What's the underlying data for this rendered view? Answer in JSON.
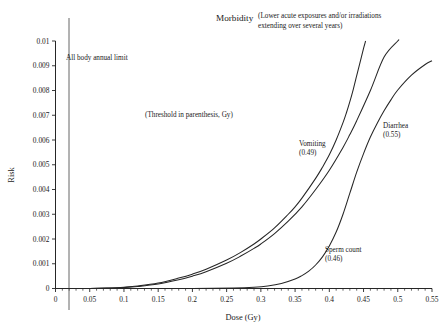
{
  "chart_data": {
    "type": "line",
    "title": "Morbidity",
    "subtitle_line1": "(Lower acute exposures and/or irradiations",
    "subtitle_line2": "extending over several years)",
    "xlabel": "Dose (Gy)",
    "ylabel": "Risk",
    "xlim": [
      0,
      0.55
    ],
    "ylim": [
      0,
      0.01
    ],
    "grid": false,
    "legend_position": "inline-annotations",
    "xticks": [
      "0",
      "0.05",
      "0.1",
      "0.15",
      "0.2",
      "0.25",
      "0.3",
      "0.35",
      "0.4",
      "0.45",
      "0.5",
      "0.55"
    ],
    "xtick_values": [
      0,
      0.05,
      0.1,
      0.15,
      0.2,
      0.25,
      0.3,
      0.35,
      0.4,
      0.45,
      0.5,
      0.55
    ],
    "yticks": [
      "0",
      "0.001",
      "0.002",
      "0.003",
      "0.004",
      "0.005",
      "0.006",
      "0.007",
      "0.008",
      "0.009",
      "0.01"
    ],
    "ytick_values": [
      0,
      0.001,
      0.002,
      0.003,
      0.004,
      0.005,
      0.006,
      0.007,
      0.008,
      0.009,
      0.01
    ],
    "notes": [
      {
        "id": "threshold-note",
        "text": "(Threshold in parenthesis, Gy)",
        "x": 0.175,
        "y": 0.0069
      },
      {
        "id": "limit-note",
        "text": "All body annual limit",
        "x": 0.035,
        "y": 0.0092
      }
    ],
    "reference_lines": [
      {
        "id": "all-body-annual-limit",
        "orientation": "vertical",
        "x": 0.02,
        "label": "All body annual limit"
      }
    ],
    "series": [
      {
        "name": "Vomiting",
        "threshold": "0.49",
        "label_line1": "Vomiting",
        "label_line2": "(0.49)",
        "label_x": 0.345,
        "label_y": 0.0058,
        "x": [
          0.0,
          0.05,
          0.08,
          0.1,
          0.12,
          0.15,
          0.18,
          0.2,
          0.22,
          0.25,
          0.27,
          0.29,
          0.3,
          0.32,
          0.34,
          0.35,
          0.36,
          0.38,
          0.39,
          0.4,
          0.41,
          0.42,
          0.425,
          0.43,
          0.435,
          0.44,
          0.445,
          0.45,
          0.455
        ],
        "y": [
          0.0,
          0.0,
          2e-05,
          5e-05,
          0.0001,
          0.00022,
          0.00042,
          0.00058,
          0.00078,
          0.00115,
          0.00145,
          0.0018,
          0.002,
          0.00245,
          0.003,
          0.0033,
          0.00365,
          0.00445,
          0.0049,
          0.0054,
          0.006,
          0.0067,
          0.0071,
          0.00755,
          0.00805,
          0.0086,
          0.00915,
          0.0097,
          0.0102
        ]
      },
      {
        "name": "Diarrhea",
        "threshold": "0.55",
        "label_line1": "Diarrhea",
        "label_line2": "(0.55)",
        "label_x": 0.465,
        "label_y": 0.0063,
        "x": [
          0.0,
          0.05,
          0.08,
          0.1,
          0.12,
          0.15,
          0.18,
          0.2,
          0.22,
          0.25,
          0.27,
          0.29,
          0.3,
          0.32,
          0.34,
          0.36,
          0.38,
          0.4,
          0.42,
          0.43,
          0.44,
          0.46,
          0.48,
          0.5,
          0.51
        ],
        "y": [
          0.0,
          0.0,
          2e-05,
          4e-05,
          8e-05,
          0.00018,
          0.00035,
          0.0005,
          0.00068,
          0.00102,
          0.0013,
          0.00162,
          0.0018,
          0.00222,
          0.00272,
          0.0033,
          0.004,
          0.00478,
          0.0057,
          0.00622,
          0.00678,
          0.008,
          0.00935,
          0.01,
          0.0102
        ]
      },
      {
        "name": "Sperm count",
        "threshold": "0.46",
        "label_line1": "Sperm count",
        "label_line2": "(0.46)",
        "label_x": 0.375,
        "label_y": 0.00145,
        "x": [
          0.0,
          0.1,
          0.2,
          0.26,
          0.29,
          0.31,
          0.33,
          0.35,
          0.36,
          0.37,
          0.38,
          0.39,
          0.4,
          0.41,
          0.42,
          0.43,
          0.44,
          0.45,
          0.46,
          0.47,
          0.48,
          0.49,
          0.5,
          0.52,
          0.54,
          0.55
        ],
        "y": [
          0.0,
          0.0,
          0.0,
          2e-05,
          5e-05,
          0.0001,
          0.0002,
          0.00038,
          0.00052,
          0.0007,
          0.00095,
          0.00128,
          0.00172,
          0.00228,
          0.003,
          0.00385,
          0.0047,
          0.00545,
          0.00612,
          0.00668,
          0.00718,
          0.00762,
          0.00802,
          0.00862,
          0.00905,
          0.0092
        ]
      }
    ]
  }
}
